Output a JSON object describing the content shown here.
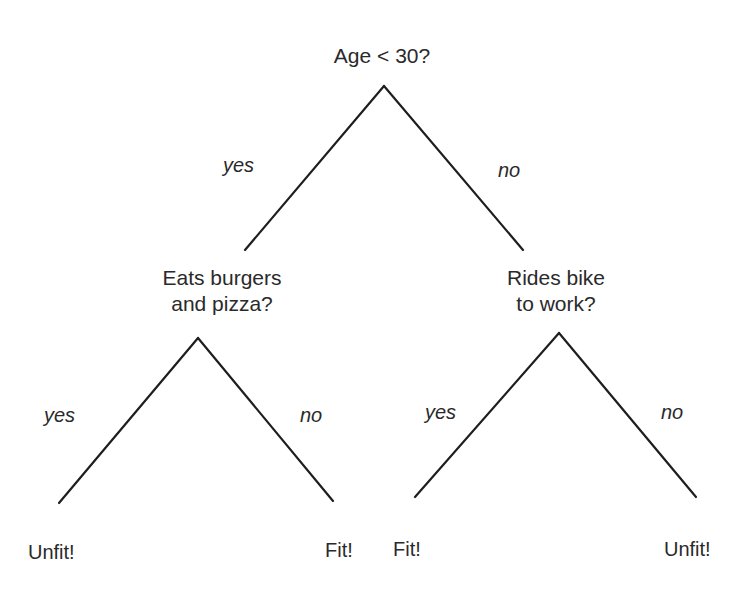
{
  "diagram": {
    "type": "decision-tree",
    "root": {
      "question": "Age < 30?",
      "yes_label": "yes",
      "no_label": "no"
    },
    "left_node": {
      "question_line1": "Eats burgers",
      "question_line2": "and pizza?",
      "yes_label": "yes",
      "no_label": "no",
      "yes_leaf": "Unfit!",
      "no_leaf": "Fit!"
    },
    "right_node": {
      "question_line1": "Rides bike",
      "question_line2": "to work?",
      "yes_label": "yes",
      "no_label": "no",
      "yes_leaf": "Fit!",
      "no_leaf": "Unfit!"
    }
  }
}
